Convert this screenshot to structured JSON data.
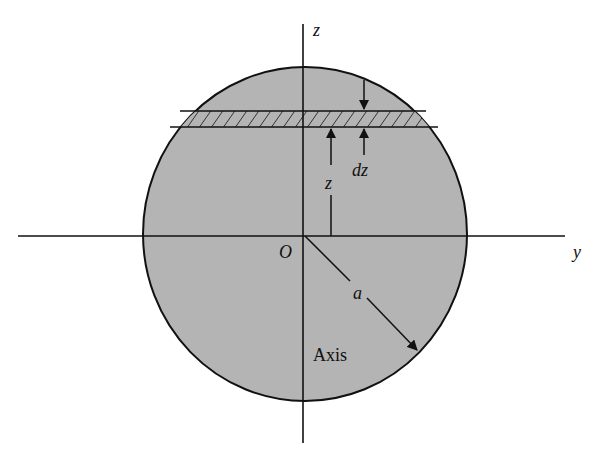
{
  "figure": {
    "type": "diagram",
    "colors": {
      "disk_fill": "#b4b4b4",
      "line": "#111111",
      "background": "#ffffff"
    },
    "labels": {
      "z_axis": "z",
      "y_axis": "y",
      "origin": "O",
      "height": "z",
      "thickness": "dz",
      "radius": "a",
      "axis": "Axis"
    }
  }
}
